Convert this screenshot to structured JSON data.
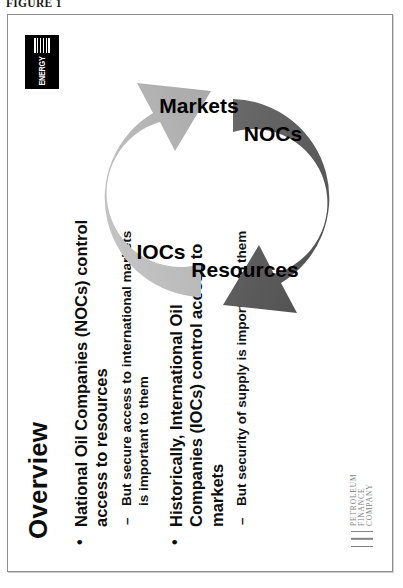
{
  "figure": {
    "caption": "FIGURE 1"
  },
  "slide": {
    "title": "Overview",
    "bullets": [
      {
        "marker": "•",
        "level": 1,
        "text": "National Oil Companies (NOCs) control access to resources"
      },
      {
        "marker": "–",
        "level": 2,
        "text": "But secure access to international markets is important to them"
      },
      {
        "marker": "•",
        "level": 1,
        "text": "Historically, International Oil Companies (IOCs) control access to markets"
      },
      {
        "marker": "–",
        "level": 2,
        "text": "But security of supply is important to them"
      }
    ],
    "diagram": {
      "type": "cycle",
      "arrows": [
        {
          "id": "upper-arrow",
          "color": "#b3b3b3",
          "labels": [
            "IOCs",
            "Markets"
          ]
        },
        {
          "id": "lower-arrow",
          "color": "#595959",
          "labels": [
            "Resources",
            "NOCs"
          ]
        }
      ],
      "label_iocs": "IOCs",
      "label_markets": "Markets",
      "label_resources": "Resources",
      "label_nocs": "NOCs"
    },
    "energy_intelligence_logo": {
      "word": "ENERGY",
      "line1": "INTELLIGENCE",
      "line2": "SERVICES"
    },
    "pfc_logo": {
      "line1": "PETROLEUM",
      "line2": "FINANCE",
      "line3": "COMPANY"
    }
  },
  "colors": {
    "arrow_light": "#b3b3b3",
    "arrow_dark": "#595959",
    "frame_border": "#8d8d8d",
    "text": "#0d0d0d"
  }
}
